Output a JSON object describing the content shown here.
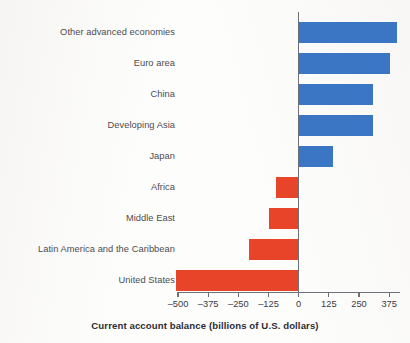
{
  "chart_data": {
    "type": "bar",
    "orientation": "horizontal",
    "title": "",
    "xlabel": "Current account balance (billions of U.S. dollars)",
    "ylabel": "",
    "categories": [
      "Other advanced economies",
      "Euro area",
      "China",
      "Developing Asia",
      "Japan",
      "Africa",
      "Middle East",
      "Latin America and the Caribbean",
      "United States"
    ],
    "values": [
      407,
      377,
      308,
      308,
      141,
      -94,
      -124,
      -205,
      -509
    ],
    "xlim": [
      -500,
      420
    ],
    "xticks": [
      -500,
      -375,
      -250,
      -125,
      0,
      125,
      250,
      375
    ],
    "xticklabels": [
      "–500",
      "–375",
      "–250",
      "–125",
      "0",
      "125",
      "250",
      "375"
    ],
    "grid": false,
    "legend": null,
    "colors": {
      "positive": "#3a76c4",
      "negative": "#e8442a",
      "axis": "#6f6f77",
      "label_text": "#4c4c52",
      "tick_text": "#3b3b41",
      "axis_title_text": "#2c2c33",
      "background": "#fdfdfc"
    }
  }
}
